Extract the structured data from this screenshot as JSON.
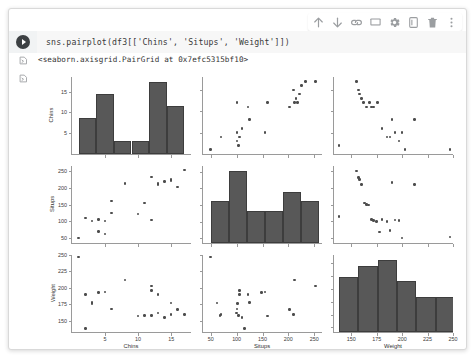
{
  "window": {
    "title": "colab-notebook-cell"
  },
  "toolbar": {
    "items": [
      {
        "name": "move-cell-up-icon",
        "label": "Move cell up"
      },
      {
        "name": "move-cell-down-icon",
        "label": "Move cell down"
      },
      {
        "name": "link-to-cell-icon",
        "label": "Link to cell"
      },
      {
        "name": "add-comment-icon",
        "label": "Add comment"
      },
      {
        "name": "cell-settings-gear-icon",
        "label": "Settings"
      },
      {
        "name": "mirror-cell-icon",
        "label": "Mirror cell in tab"
      },
      {
        "name": "delete-cell-icon",
        "label": "Delete cell"
      },
      {
        "name": "more-options-icon",
        "label": "More cell actions"
      }
    ]
  },
  "cell": {
    "run_button_label": "Run cell",
    "code": "sns.pairplot(df3[['Chins', 'Situps', 'Weight']])",
    "output_text": "<seaborn.axisgrid.PairGrid at 0x7efc5315bf10>",
    "output_text_icon": "output-caret-icon",
    "output_plot_icon": "output-caret-icon"
  },
  "chart_data": {
    "type": "scatter",
    "title": "",
    "layout": "pairgrid 3x3",
    "variables": [
      "Chins",
      "Situps",
      "Weight"
    ],
    "axes": {
      "Chins": {
        "label": "Chins",
        "ticks": [
          5,
          10,
          15
        ],
        "lim": [
          0,
          18
        ]
      },
      "Situps": {
        "label": "Situps",
        "ticks": [
          50,
          100,
          150,
          200,
          250
        ],
        "lim": [
          35,
          265
        ]
      },
      "Weight": {
        "label": "Weight",
        "ticks": [
          150,
          175,
          200,
          225,
          250
        ],
        "lim": [
          133,
          250
        ]
      }
    },
    "diagonal_axes": {
      "Chins": {
        "ticks": [
          5,
          10,
          15
        ],
        "lim": [
          0,
          18.5
        ]
      },
      "Situps": {
        "ticks": [
          50,
          100,
          150,
          200,
          250
        ],
        "lim": [
          35,
          268
        ]
      },
      "Weight": {
        "ticks": [
          140,
          160,
          180,
          200,
          220,
          240
        ],
        "lim": [
          133,
          252
        ]
      }
    },
    "histograms": [
      {
        "variable": "Chins",
        "ylabel_ticks": [
          5,
          10,
          15
        ],
        "bin_edges": [
          1,
          3.67,
          6.33,
          9.0,
          11.67,
          14.33,
          17
        ],
        "counts": [
          8.5,
          14.2,
          3.0,
          3.0,
          17.0,
          11.4
        ]
      },
      {
        "variable": "Situps",
        "ylabel_ticks": [
          50,
          100,
          150,
          200,
          250
        ],
        "bin_edges": [
          50,
          85,
          120,
          155,
          190,
          225,
          260
        ],
        "counts": [
          148,
          253,
          112,
          113,
          181,
          148
        ]
      },
      {
        "variable": "Weight",
        "ylabel_ticks": [
          140,
          160,
          180,
          200,
          220,
          240
        ],
        "bin_edges": [
          138,
          157,
          176,
          195,
          214,
          233,
          252
        ],
        "counts": [
          192,
          228,
          250,
          178,
          121,
          121
        ]
      }
    ],
    "scatters": [
      {
        "x": "Situps",
        "y": "Chins",
        "points": [
          [
            50,
            1
          ],
          [
            101,
            5
          ],
          [
            110,
            6
          ],
          [
            105,
            4
          ],
          [
            70,
            4
          ],
          [
            125,
            8
          ],
          [
            160,
            12
          ],
          [
            101,
            12
          ],
          [
            155,
            5
          ],
          [
            122,
            11
          ],
          [
            210,
            15
          ],
          [
            233,
            17
          ],
          [
            215,
            13
          ],
          [
            212,
            12
          ],
          [
            218,
            12
          ],
          [
            222,
            14
          ],
          [
            225,
            16
          ],
          [
            202,
            11
          ],
          [
            253,
            17
          ],
          [
            104,
            2
          ],
          [
            101,
            3
          ]
        ]
      },
      {
        "x": "Weight",
        "y": "Chins",
        "points": [
          [
            138,
            2
          ],
          [
            155,
            17
          ],
          [
            157,
            15
          ],
          [
            160,
            13
          ],
          [
            162,
            12
          ],
          [
            165,
            11
          ],
          [
            168,
            12
          ],
          [
            170,
            11
          ],
          [
            172,
            11
          ],
          [
            176,
            12
          ],
          [
            180,
            6
          ],
          [
            185,
            4
          ],
          [
            188,
            4
          ],
          [
            190,
            8
          ],
          [
            193,
            5
          ],
          [
            197,
            3
          ],
          [
            200,
            5
          ],
          [
            203,
            1
          ],
          [
            212,
            8
          ],
          [
            247,
            1
          ],
          [
            158,
            14
          ]
        ]
      },
      {
        "x": "Chins",
        "y": "Situps",
        "points": [
          [
            1,
            50
          ],
          [
            2,
            110
          ],
          [
            3,
            101
          ],
          [
            4,
            70
          ],
          [
            4,
            105
          ],
          [
            5,
            101
          ],
          [
            5,
            62
          ],
          [
            6,
            160
          ],
          [
            6,
            125
          ],
          [
            8,
            212
          ],
          [
            10,
            122
          ],
          [
            11,
            155
          ],
          [
            12,
            232
          ],
          [
            12,
            104
          ],
          [
            13,
            210
          ],
          [
            13,
            213
          ],
          [
            14,
            218
          ],
          [
            15,
            222
          ],
          [
            15,
            225
          ],
          [
            16,
            202
          ],
          [
            17,
            253
          ]
        ]
      },
      {
        "x": "Weight",
        "y": "Situps",
        "points": [
          [
            138,
            115
          ],
          [
            155,
            250
          ],
          [
            157,
            230
          ],
          [
            158,
            225
          ],
          [
            160,
            210
          ],
          [
            163,
            155
          ],
          [
            165,
            150
          ],
          [
            167,
            148
          ],
          [
            170,
            105
          ],
          [
            172,
            102
          ],
          [
            175,
            100
          ],
          [
            178,
            68
          ],
          [
            180,
            105
          ],
          [
            185,
            100
          ],
          [
            188,
            73
          ],
          [
            190,
            215
          ],
          [
            193,
            104
          ],
          [
            197,
            102
          ],
          [
            200,
            50
          ],
          [
            212,
            210
          ],
          [
            247,
            53
          ]
        ]
      },
      {
        "x": "Chins",
        "y": "Weight",
        "points": [
          [
            1,
            247
          ],
          [
            2,
            190
          ],
          [
            3,
            178
          ],
          [
            3,
            176
          ],
          [
            4,
            193
          ],
          [
            5,
            194
          ],
          [
            6,
            168
          ],
          [
            8,
            212
          ],
          [
            10,
            157
          ],
          [
            11,
            158
          ],
          [
            12,
            203
          ],
          [
            12,
            196
          ],
          [
            12,
            158
          ],
          [
            13,
            190
          ],
          [
            13,
            162
          ],
          [
            14,
            155
          ],
          [
            15,
            160
          ],
          [
            15,
            177
          ],
          [
            16,
            167
          ],
          [
            17,
            160
          ],
          [
            2,
            138
          ]
        ]
      },
      {
        "x": "Situps",
        "y": "Weight",
        "points": [
          [
            50,
            247
          ],
          [
            62,
            177
          ],
          [
            68,
            158
          ],
          [
            70,
            160
          ],
          [
            100,
            162
          ],
          [
            101,
            168
          ],
          [
            102,
            176
          ],
          [
            104,
            158
          ],
          [
            105,
            190
          ],
          [
            105,
            196
          ],
          [
            110,
            155
          ],
          [
            115,
            138
          ],
          [
            122,
            190
          ],
          [
            125,
            178
          ],
          [
            148,
            193
          ],
          [
            155,
            194
          ],
          [
            160,
            157
          ],
          [
            202,
            167
          ],
          [
            210,
            160
          ],
          [
            212,
            212
          ],
          [
            253,
            203
          ]
        ]
      }
    ],
    "marker_color": "#4d4d4d",
    "bar_color": "#585858",
    "bar_edge_color": "#3d3d3d"
  }
}
